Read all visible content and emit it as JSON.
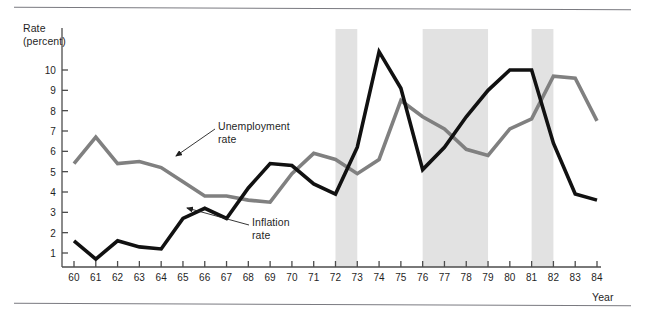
{
  "figure": {
    "y_axis_title": "Rate\n(percent)",
    "x_axis_title": "Year",
    "labels": {
      "unemployment": "Unemployment\nrate",
      "inflation": "Inflation\nrate"
    },
    "colors": {
      "unemployment_line": "#808080",
      "inflation_line": "#111111",
      "recession_band": "#e2e2e2",
      "axis": "#4d4d4d",
      "rule": "#7a7a80",
      "background": "#ffffff"
    }
  },
  "chart_data": {
    "type": "line",
    "title": "",
    "subtitle": "",
    "xlabel": "Year",
    "ylabel": "Rate (percent)",
    "xlim": [
      60,
      84
    ],
    "ylim": [
      0,
      10.8
    ],
    "grid": false,
    "legend": "annotations",
    "x_tick_labels": [
      "60",
      "61",
      "62",
      "63",
      "64",
      "65",
      "66",
      "67",
      "68",
      "69",
      "70",
      "71",
      "72",
      "73",
      "74",
      "75",
      "76",
      "77",
      "78",
      "79",
      "80",
      "81",
      "82",
      "83",
      "84"
    ],
    "y_tick_labels": [
      "1",
      "2",
      "3",
      "4",
      "5",
      "6",
      "7",
      "8",
      "9",
      "10"
    ],
    "x": [
      60,
      61,
      62,
      63,
      64,
      65,
      66,
      67,
      68,
      69,
      70,
      71,
      72,
      73,
      74,
      75,
      76,
      77,
      78,
      79,
      80,
      81,
      82,
      83,
      84
    ],
    "series": [
      {
        "name": "Unemployment rate",
        "color": "#808080",
        "values": [
          5.4,
          6.7,
          5.4,
          5.5,
          5.2,
          4.5,
          3.8,
          3.8,
          3.6,
          3.5,
          4.9,
          5.9,
          5.6,
          4.9,
          5.6,
          8.5,
          7.7,
          7.1,
          6.1,
          5.8,
          7.1,
          7.6,
          9.7,
          9.6,
          7.5
        ],
        "annotation": {
          "text": "Unemployment\nrate",
          "x": 65.5,
          "y": 5.2
        }
      },
      {
        "name": "Inflation rate",
        "color": "#111111",
        "values": [
          1.6,
          0.7,
          1.6,
          1.3,
          1.2,
          2.7,
          3.2,
          2.7,
          4.2,
          5.4,
          5.3,
          4.4,
          3.9,
          6.2,
          10.9,
          9.1,
          5.1,
          6.2,
          7.7,
          9.0,
          10.0,
          10.0,
          6.4,
          3.9,
          3.6
        ],
        "annotation": {
          "text": "Inflation\nrate",
          "x": 67.0,
          "y": 2.2
        }
      }
    ],
    "shaded_regions": [
      {
        "name": "recession-1970",
        "x_start": 72.0,
        "x_end": 73.0,
        "color": "#e2e2e2"
      },
      {
        "name": "recession-1974",
        "x_start": 76.0,
        "x_end": 79.0,
        "color": "#e2e2e2"
      },
      {
        "name": "recession-1980",
        "x_start": 81.0,
        "x_end": 82.0,
        "color": "#e2e2e2"
      }
    ]
  }
}
